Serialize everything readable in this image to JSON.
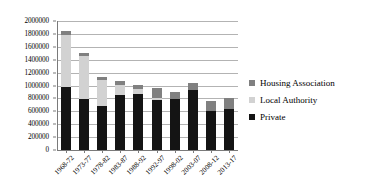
{
  "chart_data": {
    "type": "bar",
    "subtype": "stacked-column",
    "title": "",
    "xlabel": "",
    "ylabel": "",
    "categories": [
      "1968-72",
      "1973-77",
      "1978-82",
      "1983-87",
      "1988-92",
      "1992-97",
      "1998-02",
      "2003-07",
      "2008-12",
      "2013-17"
    ],
    "series": [
      {
        "name": "Private",
        "color": "#141414",
        "values": [
          980000,
          790000,
          680000,
          855000,
          870000,
          780000,
          795000,
          925000,
          600000,
          640000
        ]
      },
      {
        "name": "Local Authority",
        "color": "#d2d2d2",
        "values": [
          810000,
          670000,
          410000,
          155000,
          75000,
          20000,
          0,
          0,
          0,
          0
        ]
      },
      {
        "name": "Housing Association",
        "color": "#808080",
        "values": [
          50000,
          50000,
          45000,
          55000,
          65000,
          160000,
          110000,
          110000,
          165000,
          160000
        ]
      }
    ],
    "totals": [
      1840000,
      1510000,
      1135000,
      1065000,
      1010000,
      960000,
      905000,
      1035000,
      765000,
      800000
    ],
    "stack_order": [
      "Private",
      "Local Authority",
      "Housing Association"
    ],
    "ylim": [
      0,
      2000000
    ],
    "ytick_step": 200000,
    "ytick_labels": [
      "2000000",
      "1800000",
      "1600000",
      "1400000",
      "1200000",
      "1000000",
      "800000",
      "600000",
      "400000",
      "200000",
      "0"
    ],
    "ytick_values": [
      2000000,
      1800000,
      1600000,
      1400000,
      1200000,
      1000000,
      800000,
      600000,
      400000,
      200000,
      0
    ],
    "grid": true,
    "grid_axis": "y",
    "legend_position": "right",
    "legend": [
      {
        "label": "Housing Association",
        "color": "#808080"
      },
      {
        "label": "Local Authority",
        "color": "#d2d2d2"
      },
      {
        "label": "Private",
        "color": "#141414"
      }
    ],
    "xtick_rotation": -45,
    "background": "#ffffff",
    "gridline_color": "#b3b3b3",
    "axis_color": "#7a7a7a"
  }
}
